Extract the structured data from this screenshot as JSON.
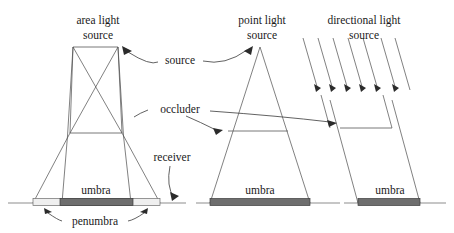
{
  "figure": {
    "background_color": "#ffffff",
    "width": 454,
    "height": 233
  },
  "colors": {
    "umbra_fill": "#6e6e6e",
    "penumbra_fill": "#efefef",
    "ray_stroke": "#4a4a4a",
    "ground_stroke": "#8d8d8d",
    "leader_stroke": "#3a3a3a",
    "text": "#1a1a1a"
  },
  "labels": {
    "area_light_line1": "area light",
    "area_light_line2": "source",
    "point_light_line1": "point light",
    "point_light_line2": "source",
    "directional_light_line1": "directional light",
    "directional_light_line2": "source",
    "source": "source",
    "occluder": "occluder",
    "receiver": "receiver",
    "umbra_area": "umbra",
    "umbra_point": "umbra",
    "umbra_directional": "umbra",
    "penumbra": "penumbra"
  },
  "scenes": [
    {
      "name": "area-light-scene",
      "light_type": "area",
      "light_bar": {
        "x1": 73,
        "x2": 118,
        "y": 47
      },
      "occluder_bar": {
        "x1": 70,
        "x2": 122,
        "y": 133
      },
      "umbra_bar": {
        "x1": 60,
        "x2": 133,
        "y": 203
      },
      "penumbra_bar": {
        "x1": 33,
        "x2": 160,
        "y": 203
      },
      "has_penumbra": true
    },
    {
      "name": "point-light-scene",
      "light_type": "point",
      "light_apex": {
        "x": 260,
        "y": 47
      },
      "occluder_bar": {
        "x1": 228,
        "x2": 288,
        "y": 131
      },
      "umbra_bar": {
        "x1": 210,
        "x2": 310,
        "y": 203
      },
      "has_penumbra": false
    },
    {
      "name": "directional-light-scene",
      "light_type": "directional",
      "ray_count": 7,
      "arrow_count": 6,
      "occluder_bar": {
        "x1": 340,
        "x2": 392,
        "y": 128
      },
      "umbra_bar": {
        "x1": 358,
        "x2": 420,
        "y": 203
      },
      "has_penumbra": false
    }
  ],
  "ground": {
    "x1": 8,
    "x2": 446,
    "y": 203
  }
}
